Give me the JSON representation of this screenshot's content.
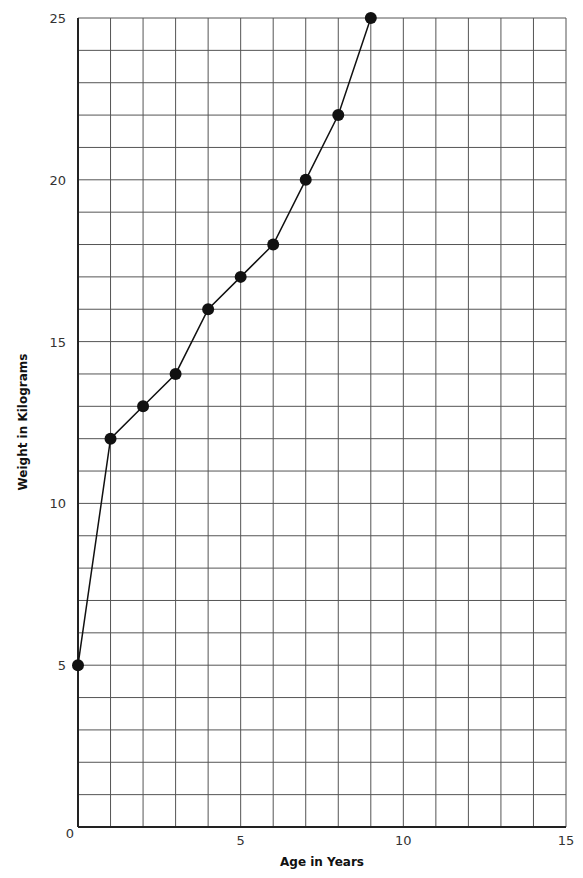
{
  "chart_data": {
    "type": "line",
    "title": "",
    "xlabel": "Age in Years",
    "ylabel": "Weight in Kilograms",
    "x": [
      0,
      1,
      2,
      3,
      4,
      5,
      6,
      7,
      8,
      9
    ],
    "series": [
      {
        "name": "Weight",
        "values": [
          5,
          12,
          13,
          14,
          16,
          17,
          18,
          20,
          22,
          25
        ],
        "marker": "filled-circle"
      }
    ],
    "xlim": [
      0,
      15
    ],
    "ylim": [
      0,
      25
    ],
    "x_ticks": [
      0,
      5,
      10,
      15
    ],
    "y_ticks": [
      0,
      5,
      10,
      15,
      20,
      25
    ],
    "x_gridlines_every": 1,
    "y_gridlines_every": 1,
    "grid": true,
    "legend": "none",
    "colors": {
      "line": "#111111",
      "marker": "#111111",
      "grid": "#555555",
      "axis": "#222222"
    }
  },
  "axes": {
    "x_title": "Age in Years",
    "y_title": "Weight in Kilograms"
  }
}
